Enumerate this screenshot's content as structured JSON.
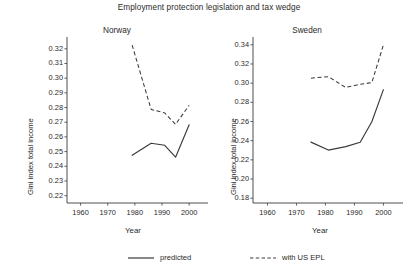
{
  "chart_data": {
    "type": "line",
    "title": "Employment protection legislation and tax wedge",
    "xlabel": "Year",
    "ylabel": "Gini index total income",
    "legend_position": "bottom",
    "grid": false,
    "panels": [
      {
        "name": "Norway",
        "xlim": [
          1955,
          2004
        ],
        "ylim": [
          0.215,
          0.326
        ],
        "xticks": [
          1960,
          1970,
          1980,
          1990,
          2000
        ],
        "xticklabels": [
          "1960",
          "1970",
          "1980",
          "1990",
          "2000"
        ],
        "yticks": [
          0.22,
          0.23,
          0.24,
          0.25,
          0.26,
          0.27,
          0.28,
          0.29,
          0.3,
          0.31,
          0.32
        ],
        "yticklabels": [
          "0.22",
          "0.23",
          "0.24",
          "0.25",
          "0.26",
          "0.27",
          "0.28",
          "0.29",
          "0.30",
          "0.31",
          "0.32"
        ],
        "series": [
          {
            "name": "predicted",
            "style": "solid",
            "x": [
              1979,
              1986,
              1991,
              1995,
              2000
            ],
            "values": [
              0.2475,
              0.2557,
              0.2543,
              0.2462,
              0.2683
            ]
          },
          {
            "name": "with US EPL",
            "style": "dashed",
            "x": [
              1979,
              1986,
              1991,
              1995,
              2000
            ],
            "values": [
              0.3225,
              0.2787,
              0.2763,
              0.2686,
              0.2815
            ]
          }
        ]
      },
      {
        "name": "Sweden",
        "xlim": [
          1955,
          2004
        ],
        "ylim": [
          0.175,
          0.345
        ],
        "xticks": [
          1960,
          1970,
          1980,
          1990,
          2000
        ],
        "xticklabels": [
          "1960",
          "1970",
          "1980",
          "1990",
          "2000"
        ],
        "yticks": [
          0.18,
          0.2,
          0.22,
          0.24,
          0.26,
          0.28,
          0.3,
          0.32,
          0.34
        ],
        "yticklabels": [
          "0.18",
          "0.20",
          "0.22",
          "0.24",
          "0.26",
          "0.28",
          "0.30",
          "0.32",
          "0.34"
        ],
        "series": [
          {
            "name": "predicted",
            "style": "solid",
            "x": [
              1975,
              1981,
              1987,
              1992,
              1996,
              2000
            ],
            "values": [
              0.2385,
              0.2302,
              0.2338,
              0.2383,
              0.2598,
              0.2932
            ]
          },
          {
            "name": "with US EPL",
            "style": "dashed",
            "x": [
              1975,
              1981,
              1987,
              1992,
              1996,
              2000
            ],
            "values": [
              0.3052,
              0.3068,
              0.2955,
              0.2988,
              0.3005,
              0.34
            ]
          }
        ]
      }
    ],
    "legend": [
      {
        "label": "predicted",
        "style": "solid"
      },
      {
        "label": "with US EPL",
        "style": "dashed"
      }
    ]
  }
}
